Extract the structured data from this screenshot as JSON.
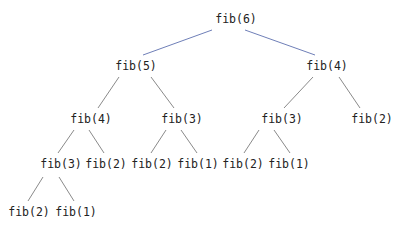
{
  "diagram": {
    "colors": {
      "edge_top": "#6f7fb8",
      "edge": "#8a8a8a",
      "text": "#222222"
    },
    "nodes": [
      {
        "id": "n0",
        "label": "fib(6)",
        "x": 236,
        "y": 20
      },
      {
        "id": "n1",
        "label": "fib(5)",
        "x": 136,
        "y": 67
      },
      {
        "id": "n2",
        "label": "fib(4)",
        "x": 327,
        "y": 67
      },
      {
        "id": "n3",
        "label": "fib(4)",
        "x": 91,
        "y": 120
      },
      {
        "id": "n4",
        "label": "fib(3)",
        "x": 182,
        "y": 120
      },
      {
        "id": "n5",
        "label": "fib(3)",
        "x": 282,
        "y": 120
      },
      {
        "id": "n6",
        "label": "fib(2)",
        "x": 372,
        "y": 120
      },
      {
        "id": "n7",
        "label": "fib(3)",
        "x": 61,
        "y": 165
      },
      {
        "id": "n8",
        "label": "fib(2)",
        "x": 106,
        "y": 165
      },
      {
        "id": "n9",
        "label": "fib(2)",
        "x": 152,
        "y": 165
      },
      {
        "id": "n10",
        "label": "fib(1)",
        "x": 198,
        "y": 165
      },
      {
        "id": "n11",
        "label": "fib(2)",
        "x": 243,
        "y": 165
      },
      {
        "id": "n12",
        "label": "fib(1)",
        "x": 289,
        "y": 165
      },
      {
        "id": "n13",
        "label": "fib(2)",
        "x": 29,
        "y": 213
      },
      {
        "id": "n14",
        "label": "fib(1)",
        "x": 76,
        "y": 213
      }
    ],
    "edges": [
      {
        "from": "n0",
        "to": "n1",
        "x1": 212,
        "y1": 30,
        "x2": 143,
        "y2": 55,
        "color": "#6f7fb8"
      },
      {
        "from": "n0",
        "to": "n2",
        "x1": 245,
        "y1": 30,
        "x2": 315,
        "y2": 55,
        "color": "#6f7fb8"
      },
      {
        "from": "n1",
        "to": "n3",
        "x1": 119,
        "y1": 77,
        "x2": 98,
        "y2": 108,
        "color": "#8a8a8a"
      },
      {
        "from": "n1",
        "to": "n4",
        "x1": 151,
        "y1": 77,
        "x2": 174,
        "y2": 108,
        "color": "#8a8a8a"
      },
      {
        "from": "n2",
        "to": "n5",
        "x1": 313,
        "y1": 77,
        "x2": 284,
        "y2": 108,
        "color": "#8a8a8a"
      },
      {
        "from": "n2",
        "to": "n6",
        "x1": 339,
        "y1": 77,
        "x2": 360,
        "y2": 108,
        "color": "#8a8a8a"
      },
      {
        "from": "n3",
        "to": "n7",
        "x1": 74,
        "y1": 130,
        "x2": 58,
        "y2": 153,
        "color": "#8a8a8a"
      },
      {
        "from": "n3",
        "to": "n8",
        "x1": 89,
        "y1": 130,
        "x2": 104,
        "y2": 153,
        "color": "#8a8a8a"
      },
      {
        "from": "n4",
        "to": "n9",
        "x1": 166,
        "y1": 130,
        "x2": 151,
        "y2": 153,
        "color": "#8a8a8a"
      },
      {
        "from": "n4",
        "to": "n10",
        "x1": 181,
        "y1": 130,
        "x2": 197,
        "y2": 153,
        "color": "#8a8a8a"
      },
      {
        "from": "n5",
        "to": "n11",
        "x1": 259,
        "y1": 130,
        "x2": 244,
        "y2": 153,
        "color": "#8a8a8a"
      },
      {
        "from": "n5",
        "to": "n12",
        "x1": 274,
        "y1": 130,
        "x2": 290,
        "y2": 153,
        "color": "#8a8a8a"
      },
      {
        "from": "n7",
        "to": "n13",
        "x1": 43,
        "y1": 177,
        "x2": 28,
        "y2": 201,
        "color": "#8a8a8a"
      },
      {
        "from": "n7",
        "to": "n14",
        "x1": 59,
        "y1": 177,
        "x2": 74,
        "y2": 201,
        "color": "#8a8a8a"
      }
    ]
  }
}
